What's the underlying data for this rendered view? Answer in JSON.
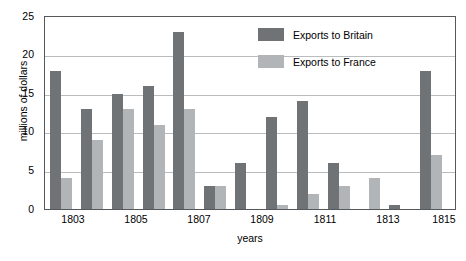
{
  "chart_data": {
    "type": "bar",
    "title": "",
    "xlabel": "years",
    "ylabel": "millions of dollars",
    "ylim": [
      0,
      25
    ],
    "yticks": [
      0,
      5,
      10,
      15,
      20,
      25
    ],
    "grid": true,
    "legend_position": "upper-right",
    "categories": [
      1803,
      1804,
      1805,
      1806,
      1807,
      1808,
      1809,
      1810,
      1811,
      1812,
      1813,
      1814,
      1815
    ],
    "xtick_labels": [
      "1803",
      "1805",
      "1807",
      "1809",
      "1811",
      "1813",
      "1815"
    ],
    "series": [
      {
        "name": "Exports to Britain",
        "color": "#6f7376",
        "values": [
          18,
          13,
          15,
          16,
          23,
          3,
          6,
          12,
          14,
          6,
          0,
          0.5,
          18
        ]
      },
      {
        "name": "Exports to France",
        "color": "#b2b5b7",
        "values": [
          4,
          9,
          13,
          11,
          13,
          3,
          0,
          0.5,
          2,
          3,
          4,
          0,
          7
        ]
      }
    ]
  },
  "legend": {
    "items": [
      {
        "label": "Exports to Britain",
        "swatch": "britain-swatch"
      },
      {
        "label": "Exports to France",
        "swatch": "france-swatch"
      }
    ]
  },
  "axes": {
    "y_title": "millions of dollars",
    "x_title": "years",
    "y_ticks": [
      "0",
      "5",
      "10",
      "15",
      "20",
      "25"
    ],
    "x_ticks": [
      "1803",
      "1805",
      "1807",
      "1809",
      "1811",
      "1813",
      "1815"
    ]
  }
}
